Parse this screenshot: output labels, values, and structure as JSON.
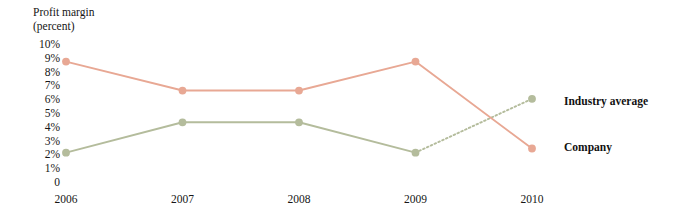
{
  "chart_data": {
    "type": "line",
    "title": "Profit margin (percent)",
    "title_lines": [
      "Profit margin",
      "(percent)"
    ],
    "xlabel": "",
    "ylabel": "Profit margin (percent)",
    "categories": [
      "2006",
      "2007",
      "2008",
      "2009",
      "2010"
    ],
    "x": [
      2006,
      2007,
      2008,
      2009,
      2010
    ],
    "ylim": [
      0,
      10
    ],
    "xlim": [
      2006,
      2010
    ],
    "grid": false,
    "legend_position": "right",
    "y_ticks": [
      {
        "label": "10%",
        "value": 10
      },
      {
        "label": "9%",
        "value": 9
      },
      {
        "label": "8%",
        "value": 8
      },
      {
        "label": "7%",
        "value": 7
      },
      {
        "label": "6%",
        "value": 6
      },
      {
        "label": "5%",
        "value": 5
      },
      {
        "label": "4%",
        "value": 4
      },
      {
        "label": "3%",
        "value": 3
      },
      {
        "label": "2%",
        "value": 2
      },
      {
        "label": "1%",
        "value": 1
      },
      {
        "label": "0",
        "value": 0
      }
    ],
    "series": [
      {
        "name": "Industry average",
        "color": "#b4bc9c",
        "marker": "circle",
        "values": [
          2.2,
          4.4,
          4.4,
          2.2,
          6.1
        ],
        "segment_styles": [
          "solid",
          "solid",
          "solid",
          "dotted"
        ]
      },
      {
        "name": "Company",
        "color": "#e8a894",
        "marker": "circle",
        "values": [
          8.8,
          6.7,
          6.7,
          8.8,
          2.5
        ],
        "segment_styles": [
          "solid",
          "solid",
          "solid",
          "solid"
        ]
      }
    ],
    "annotations": [
      "Industry average projected from 2009 to 2010 (dotted segment)"
    ]
  },
  "legend": {
    "industry_average": "Industry average",
    "company": "Company"
  }
}
